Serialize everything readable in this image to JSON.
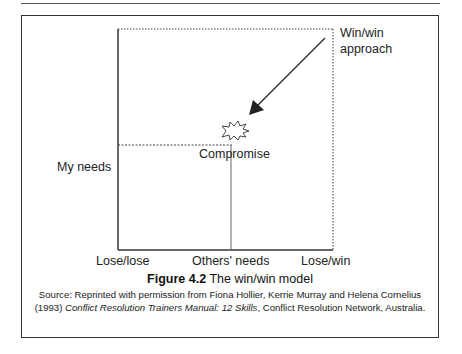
{
  "figure": {
    "number_label": "Figure 4.2",
    "title": "The win/win model",
    "source_prefix": "Source: Reprinted with permission from Fiona Hollier, Kerrie Murray and Helena Cornelius (1993) ",
    "source_book_title": "Conflict Resolution Trainers Manual: 12 Skills",
    "source_suffix": ", Conflict Resolution Network, Australia."
  },
  "diagram": {
    "y_axis_label": "My needs",
    "x_axis_labels": {
      "left": "Lose/lose",
      "middle": "Others' needs",
      "right": "Lose/win"
    },
    "corner_label_line1": "Win/win",
    "corner_label_line2": "approach",
    "center_label": "Compromise",
    "arrow": {
      "from": "Win/win corner",
      "to": "Compromise point"
    },
    "colors": {
      "line": "#333333",
      "text": "#222222",
      "background": "#ffffff"
    }
  }
}
